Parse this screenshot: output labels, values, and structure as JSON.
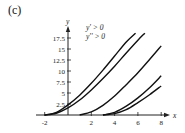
{
  "panel_label": "(c)",
  "chart_data": {
    "type": "line",
    "title": "",
    "xlabel": "x",
    "ylabel": "y",
    "xlim": [
      -2.5,
      8.5
    ],
    "ylim": [
      0,
      19
    ],
    "grid": false,
    "x_ticks": [
      "-2",
      "2",
      "4",
      "6",
      "8"
    ],
    "y_ticks": [
      "2.5",
      "5",
      "7.5",
      "10",
      "12.5",
      "15",
      "17.5"
    ],
    "annotations": [
      "y' > 0",
      "y'' > 0"
    ],
    "series": [
      {
        "name": "curve-1",
        "x": [
          -2,
          -1,
          0,
          1,
          2,
          3,
          4,
          5,
          5.8
        ],
        "y": [
          0,
          0.6,
          2.3,
          4.5,
          7.2,
          10.2,
          13.4,
          16.6,
          18.6
        ]
      },
      {
        "name": "curve-2",
        "x": [
          -2,
          -1,
          0,
          1,
          2,
          3,
          4,
          5,
          6,
          6.6
        ],
        "y": [
          0,
          0.4,
          1.6,
          3.4,
          5.7,
          8.3,
          11.1,
          14.1,
          17.0,
          18.6
        ]
      },
      {
        "name": "curve-3",
        "x": [
          1,
          2,
          3,
          4,
          5,
          6,
          7,
          8
        ],
        "y": [
          0,
          0.7,
          2.2,
          4.3,
          6.9,
          9.6,
          12.6,
          15.7
        ]
      },
      {
        "name": "curve-4",
        "x": [
          3,
          4,
          5,
          6,
          7,
          8
        ],
        "y": [
          0,
          0.6,
          2.0,
          3.9,
          6.2,
          8.9
        ]
      },
      {
        "name": "curve-5",
        "x": [
          3,
          4,
          5,
          6,
          7,
          8
        ],
        "y": [
          0,
          0.3,
          1.2,
          2.8,
          4.6,
          6.6
        ]
      }
    ]
  }
}
